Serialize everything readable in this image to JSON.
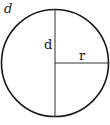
{
  "diagram": {
    "title_label": "d",
    "diameter_label": "d",
    "radius_label": "r",
    "colors": {
      "stroke": "#1a1a1a",
      "background": "#ffffff"
    }
  }
}
